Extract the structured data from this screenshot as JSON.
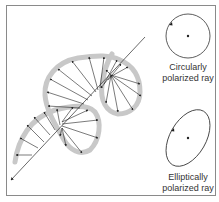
{
  "diagram": {
    "title": "",
    "main_figure": "Helical path of electric vector along propagation axis",
    "labels": {
      "circular": {
        "line1": "Circularly",
        "line2": "polarized ray"
      },
      "elliptical": {
        "line1": "Elliptically",
        "line2": "polarized ray"
      }
    },
    "colors": {
      "helix_band": "#c8c8c8",
      "vectors": "#222222",
      "axis": "#444444",
      "frame": "#8a8a8a",
      "text": "#333333"
    }
  }
}
